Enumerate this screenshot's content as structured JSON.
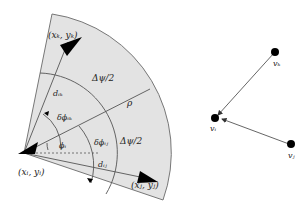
{
  "figure": {
    "left_panel": {
      "labels": {
        "xk_yk": "(xₖ, yₖ)",
        "xi_yi": "(xᵢ, yᵢ)",
        "xj_yj": "(xⱼ, yⱼ)",
        "delta_psi_half_top": "Δψ/2",
        "delta_psi_half_bottom": "Δψ/2",
        "rho": "ρ",
        "d_ik": "dᵢₖ",
        "d_ij": "dᵢⱼ",
        "delta_phi_ik": "δϕᵢₖ",
        "delta_phi_ij": "δϕᵢⱼ",
        "phi_i": "ϕᵢ"
      },
      "colors": {
        "sector_fill": "#e3e3e3",
        "sector_stroke": "#777777",
        "arrow_fill": "#000000"
      }
    },
    "right_panel": {
      "nodes": [
        {
          "id": "v_k",
          "label": "vₖ"
        },
        {
          "id": "v_i",
          "label": "vᵢ"
        },
        {
          "id": "v_j",
          "label": "vⱼ"
        }
      ],
      "edges": [
        {
          "from": "v_k",
          "to": "v_i"
        },
        {
          "from": "v_j",
          "to": "v_i"
        }
      ]
    }
  }
}
